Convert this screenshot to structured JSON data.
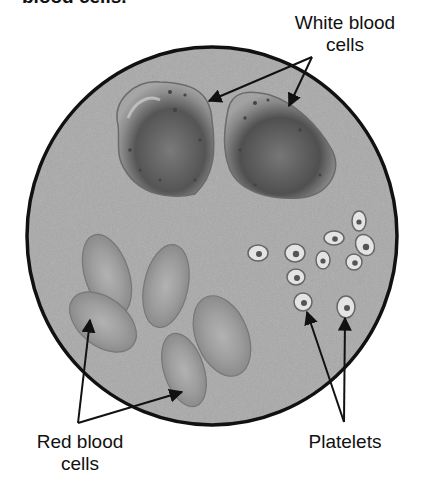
{
  "caption": "blood cells.",
  "labels": {
    "white_blood_cells": {
      "line1": "White blood",
      "line2": "cells"
    },
    "red_blood_cells": {
      "line1": "Red blood",
      "line2": "cells"
    },
    "platelets": {
      "line1": "Platelets"
    }
  },
  "colors": {
    "background": "#ffffff",
    "field": "#a9a9a9",
    "outline": "#111111",
    "wbc_fill": "#8a8a8a",
    "wbc_core": "#5a5a5a",
    "rbc_fill": "#9a9a9a",
    "rbc_center": "#b5b5b5",
    "platelet_fill": "#e6e6e6",
    "platelet_core": "#555555"
  }
}
